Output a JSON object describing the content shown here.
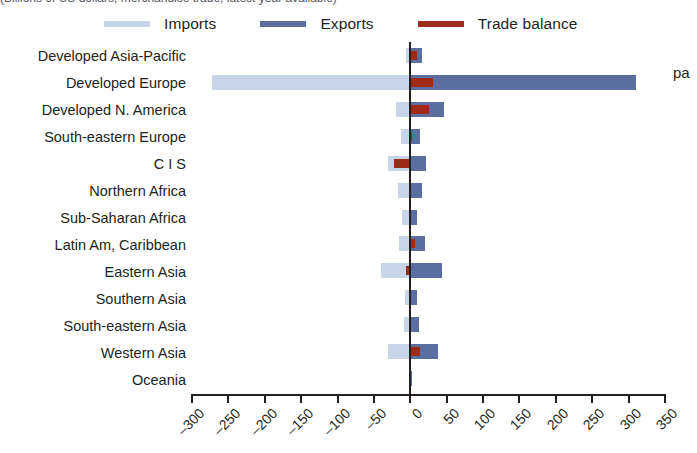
{
  "figure": {
    "caption_sliver": "(Billions of US dollars, merchandise trade, latest year available)",
    "edge_word": "pa"
  },
  "legend": {
    "position": "top",
    "items": [
      {
        "label": "Imports",
        "color": "#c8d5e8",
        "icon": "legend-swatch-imports"
      },
      {
        "label": "Exports",
        "color": "#5b6ea0",
        "icon": "legend-swatch-exports"
      },
      {
        "label": "Trade balance",
        "color": "#9e2a18",
        "icon": "legend-swatch-trade-balance"
      }
    ]
  },
  "axis": {
    "xlabel": "",
    "ylabel": "",
    "xlim": [
      -300,
      350
    ],
    "xtick_step": 50,
    "xticks": [
      "-300",
      "-250",
      "-200",
      "-150",
      "-100",
      "-50",
      "0",
      "50",
      "100",
      "150",
      "200",
      "250",
      "300",
      "350"
    ],
    "grid": false,
    "zero_line": true
  },
  "chart_data": {
    "type": "bar",
    "orientation": "horizontal",
    "title": "",
    "subtitle": "",
    "xlabel": "Billions of US dollars",
    "ylabel": "",
    "xlim": [
      -300,
      350
    ],
    "grid": false,
    "legend_position": "top",
    "categories": [
      "Developed Asia-Pacific",
      "Developed Europe",
      "Developed N. America",
      "South-eastern Europe",
      "C I S",
      "Northern Africa",
      "Sub-Saharan Africa",
      "Latin Am, Caribbean",
      "Eastern Asia",
      "Southern Asia",
      "South-eastern Asia",
      "Western Asia",
      "Oceania"
    ],
    "series": [
      {
        "name": "Imports",
        "color": "#c8d5e8",
        "values": [
          -6,
          -272,
          -19,
          -13,
          -30,
          -17,
          -11,
          -15,
          -40,
          -7,
          -9,
          -31,
          -1
        ]
      },
      {
        "name": "Exports",
        "color": "#5b6ea0",
        "values": [
          16,
          310,
          47,
          14,
          21,
          16,
          9,
          20,
          43,
          9,
          12,
          38,
          1
        ]
      },
      {
        "name": "Trade balance",
        "color": "#9e2a18",
        "values": [
          9,
          31,
          26,
          2,
          -22,
          0,
          0,
          7,
          -6,
          0,
          0,
          13,
          0
        ]
      }
    ]
  }
}
